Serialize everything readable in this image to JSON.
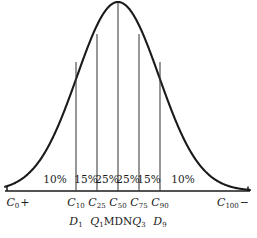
{
  "chart_data": {
    "type": "area",
    "title": "",
    "subtitle": "",
    "xlabel": "",
    "ylabel": "",
    "grid": false,
    "legend": null,
    "axis": {
      "baseline_y": 191,
      "x_start": 5,
      "x_end": 250,
      "curve_peak_x": 118,
      "curve_peak_y": 2
    },
    "curve": {
      "type": "normal",
      "mean_x": 118,
      "sigma_px": 41,
      "amplitude_px": 189
    },
    "segments": [
      {
        "pct_label": "10%",
        "value": 10,
        "center_x": 55
      },
      {
        "pct_label": "15%",
        "value": 15,
        "center_x": 86
      },
      {
        "pct_label": "25%",
        "value": 25,
        "center_x": 107
      },
      {
        "pct_label": "25%",
        "value": 25,
        "center_x": 128
      },
      {
        "pct_label": "15%",
        "value": 15,
        "center_x": 149
      },
      {
        "pct_label": "10%",
        "value": 10,
        "center_x": 183
      }
    ],
    "pct_label_y": 174,
    "ordinates": [
      {
        "x": 76,
        "top_y": 62,
        "centile": "C",
        "centile_sub": "10",
        "alt": "D",
        "alt_sub": "1",
        "alt_upright": false
      },
      {
        "x": 97,
        "top_y": 34,
        "centile": "C",
        "centile_sub": "25",
        "alt": "Q",
        "alt_sub": "1",
        "alt_upright": false
      },
      {
        "x": 118,
        "top_y": 3,
        "centile": "C",
        "centile_sub": "50",
        "alt": "MDN",
        "alt_sub": "",
        "alt_upright": true
      },
      {
        "x": 139,
        "top_y": 34,
        "centile": "C",
        "centile_sub": "75",
        "alt": "Q",
        "alt_sub": "3",
        "alt_upright": false
      },
      {
        "x": 160,
        "top_y": 62,
        "centile": "C",
        "centile_sub": "90",
        "alt": "D",
        "alt_sub": "9",
        "alt_upright": false
      }
    ],
    "ordinate_label_y": 197,
    "alt_label_y": 216,
    "end_labels": [
      {
        "text": "C",
        "sub": "0",
        "sign": "+",
        "x": 18,
        "y": 197,
        "tick_x": 7
      },
      {
        "text": "C",
        "sub": "100",
        "sign": "−",
        "x": 233,
        "y": 197,
        "tick_x": 248
      }
    ],
    "colors": {
      "curve": "#1a1a1a",
      "baseline": "#1a1a1a",
      "ordinate": "#3a3a3a",
      "text": "#1a1a1a",
      "background": "#ffffff"
    }
  }
}
